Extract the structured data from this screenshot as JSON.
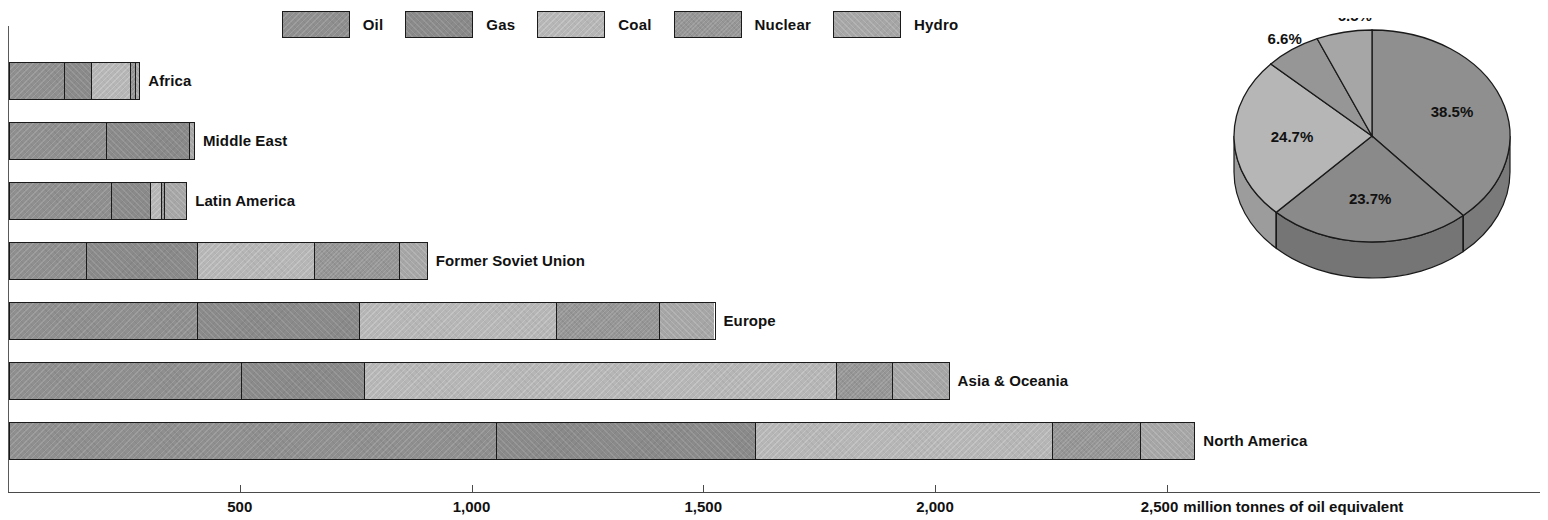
{
  "legend": {
    "items": [
      {
        "label": "Oil",
        "key": "oil",
        "color": "#8f8f8f"
      },
      {
        "label": "Gas",
        "key": "gas",
        "color": "#8a8a8a"
      },
      {
        "label": "Coal",
        "key": "coal",
        "color": "#b6b6b6"
      },
      {
        "label": "Nuclear",
        "key": "nuclear",
        "color": "#969696"
      },
      {
        "label": "Hydro",
        "key": "hydro",
        "color": "#a6a6a6"
      }
    ]
  },
  "axis": {
    "units_label": "million tonnes of oil equivalent",
    "ticks": [
      {
        "value": 500,
        "label": "500"
      },
      {
        "value": 1000,
        "label": "1,000"
      },
      {
        "value": 1500,
        "label": "1,500"
      },
      {
        "value": 2000,
        "label": "2,000"
      },
      {
        "value": 2500,
        "label": "2,500"
      }
    ],
    "min": 0,
    "max": 2500
  },
  "chart_data": {
    "type": "bar",
    "orientation": "horizontal",
    "stacked": true,
    "title": "",
    "xlabel": "million tonnes of oil equivalent",
    "ylabel": "",
    "xlim": [
      0,
      2500
    ],
    "grid": false,
    "legend_position": "top",
    "categories": [
      "Africa",
      "Middle East",
      "Latin America",
      "Former Soviet Union",
      "Europe",
      "Asia & Oceania",
      "North America"
    ],
    "series": [
      {
        "name": "Oil",
        "values": [
          118,
          209,
          219,
          166,
          405,
          500,
          1050
        ]
      },
      {
        "name": "Gas",
        "values": [
          58,
          179,
          86,
          240,
          350,
          265,
          560
        ]
      },
      {
        "name": "Coal",
        "values": [
          86,
          0,
          22,
          252,
          425,
          1020,
          640
        ]
      },
      {
        "name": "Nuclear",
        "values": [
          9,
          0,
          8,
          183,
          222,
          120,
          190
        ]
      },
      {
        "name": "Hydro",
        "values": [
          8,
          9,
          45,
          58,
          118,
          120,
          115
        ]
      }
    ],
    "totals": [
      279,
      397,
      380,
      899,
      1520,
      2025,
      2555
    ]
  },
  "pie": {
    "type": "pie",
    "title": "",
    "labels": [
      "Oil",
      "Gas",
      "Coal",
      "Nuclear",
      "Hydro"
    ],
    "values": [
      38.5,
      23.7,
      24.7,
      6.6,
      6.5
    ],
    "display_labels": [
      "38.5%",
      "23.7%",
      "24.7%",
      "6.6%",
      "6.5%"
    ],
    "style": "3d"
  }
}
